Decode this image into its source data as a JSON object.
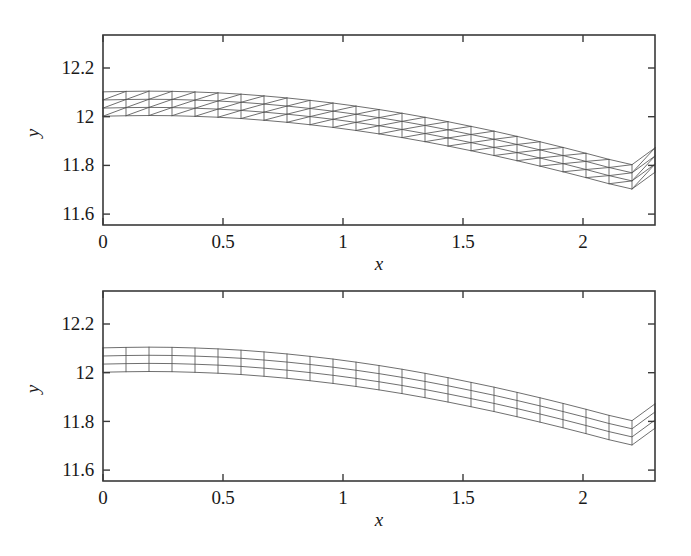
{
  "figure": {
    "background": "#ffffff",
    "line_color": "#555555",
    "frame_color": "#3a3a3a",
    "text_color": "#191919"
  },
  "panels": [
    {
      "id": "top",
      "mesh_type": "triangular",
      "axis": {
        "x_label": "x",
        "y_label": "y",
        "x_ticks": [
          "0",
          "0.5",
          "1",
          "1.5",
          "2"
        ],
        "x_tick_values": [
          0,
          0.5,
          1,
          1.5,
          2
        ],
        "y_ticks": [
          "12.2",
          "12",
          "11.8",
          "11.6"
        ],
        "y_tick_values": [
          12.2,
          12,
          11.8,
          11.6
        ],
        "xlim": [
          0,
          2.3
        ],
        "ylim": [
          11.52,
          12.32
        ]
      }
    },
    {
      "id": "bottom",
      "mesh_type": "quadrilateral",
      "axis": {
        "x_label": "x",
        "y_label": "y",
        "x_ticks": [
          "0",
          "0.5",
          "1",
          "1.5",
          "2"
        ],
        "x_tick_values": [
          0,
          0.5,
          1,
          1.5,
          2
        ],
        "y_ticks": [
          "12.2",
          "12",
          "11.8",
          "11.6"
        ],
        "y_tick_values": [
          12.2,
          12,
          11.8,
          11.6
        ],
        "xlim": [
          0,
          2.3
        ],
        "ylim": [
          11.52,
          12.32
        ]
      }
    }
  ],
  "chart_data": {
    "type": "line",
    "title": "",
    "subtitle": "",
    "xlabel": "x",
    "ylabel": "y",
    "xlim": [
      0,
      2.3
    ],
    "ylim": [
      11.52,
      12.32
    ],
    "grid": false,
    "legend": "none",
    "panels": [
      {
        "name": "triangular mesh",
        "mesh_type": "triangular",
        "columns": 24,
        "rows": 3,
        "x_start": 0.0,
        "x_end": 2.3,
        "thickness": 0.1,
        "series": [
          {
            "name": "top surface",
            "x": [
              0.0,
              0.1,
              0.2,
              0.3,
              0.4,
              0.5,
              0.6,
              0.7,
              0.8,
              0.9,
              1.0,
              1.1,
              1.2,
              1.3,
              1.4,
              1.5,
              1.6,
              1.7,
              1.8,
              1.9,
              2.0,
              2.1,
              2.2,
              2.3
            ],
            "values": [
              12.102,
              12.104,
              12.105,
              12.104,
              12.101,
              12.097,
              12.091,
              12.083,
              12.074,
              12.063,
              12.051,
              12.037,
              12.022,
              12.005,
              11.987,
              11.967,
              11.947,
              11.925,
              11.902,
              11.878,
              11.853,
              11.827,
              11.8,
              11.872
            ]
          },
          {
            "name": "bottom surface",
            "x": [
              0.0,
              0.1,
              0.2,
              0.3,
              0.4,
              0.5,
              0.6,
              0.7,
              0.8,
              0.9,
              1.0,
              1.1,
              1.2,
              1.3,
              1.4,
              1.5,
              1.6,
              1.7,
              1.8,
              1.9,
              2.0,
              2.1,
              2.2,
              2.3
            ],
            "values": [
              12.002,
              12.004,
              12.005,
              12.004,
              12.001,
              11.997,
              11.991,
              11.983,
              11.974,
              11.963,
              11.951,
              11.937,
              11.922,
              11.905,
              11.887,
              11.867,
              11.847,
              11.825,
              11.802,
              11.778,
              11.753,
              11.727,
              11.7,
              11.772
            ]
          }
        ]
      },
      {
        "name": "quadrilateral mesh",
        "mesh_type": "quadrilateral",
        "columns": 24,
        "rows": 3,
        "x_start": 0.0,
        "x_end": 2.3,
        "thickness": 0.1,
        "series": [
          {
            "name": "top surface",
            "x": [
              0.0,
              0.1,
              0.2,
              0.3,
              0.4,
              0.5,
              0.6,
              0.7,
              0.8,
              0.9,
              1.0,
              1.1,
              1.2,
              1.3,
              1.4,
              1.5,
              1.6,
              1.7,
              1.8,
              1.9,
              2.0,
              2.1,
              2.2,
              2.3
            ],
            "values": [
              12.102,
              12.104,
              12.105,
              12.104,
              12.101,
              12.097,
              12.091,
              12.083,
              12.074,
              12.063,
              12.051,
              12.037,
              12.022,
              12.005,
              11.987,
              11.967,
              11.947,
              11.925,
              11.902,
              11.878,
              11.853,
              11.827,
              11.8,
              11.872
            ]
          },
          {
            "name": "bottom surface",
            "x": [
              0.0,
              0.1,
              0.2,
              0.3,
              0.4,
              0.5,
              0.6,
              0.7,
              0.8,
              0.9,
              1.0,
              1.1,
              1.2,
              1.3,
              1.4,
              1.5,
              1.6,
              1.7,
              1.8,
              1.9,
              2.0,
              2.1,
              2.2,
              2.3
            ],
            "values": [
              12.002,
              12.004,
              12.005,
              12.004,
              12.001,
              11.997,
              11.991,
              11.983,
              11.974,
              11.963,
              11.951,
              11.937,
              11.922,
              11.905,
              11.887,
              11.867,
              11.847,
              11.825,
              11.802,
              11.778,
              11.753,
              11.727,
              11.7,
              11.772
            ]
          }
        ]
      }
    ]
  }
}
